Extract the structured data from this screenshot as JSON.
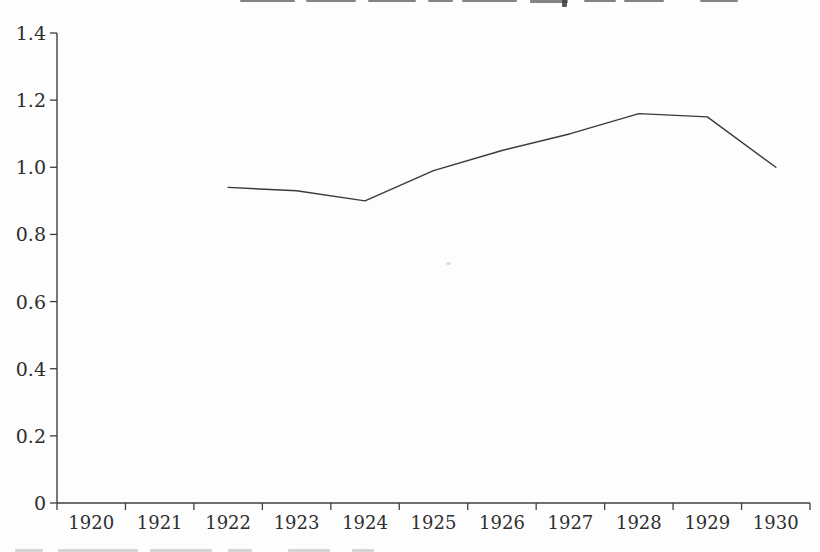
{
  "page": {
    "background": "#fdfdfd",
    "artifacts": {
      "top_edge": "bottom sliver of text line cut off at top of scan (illegible)",
      "bottom_edge": "top sliver of caption line cut off at bottom of scan (illegible)",
      "speck": "faint gray speck near plot center"
    }
  },
  "chart_data": {
    "type": "line",
    "title": "",
    "xlabel": "",
    "ylabel": "",
    "x": [
      1922,
      1923,
      1924,
      1925,
      1926,
      1927,
      1928,
      1929,
      1930
    ],
    "values": [
      0.94,
      0.93,
      0.9,
      0.99,
      1.05,
      1.1,
      1.16,
      1.15,
      1.0
    ],
    "x_axis_categories": [
      "1920",
      "1921",
      "1922",
      "1923",
      "1924",
      "1925",
      "1926",
      "1927",
      "1928",
      "1929",
      "1930"
    ],
    "x_axis_year_start": 1920,
    "x_axis_segments": 11,
    "yticks": [
      0,
      0.2,
      0.4,
      0.6,
      0.8,
      1.0,
      1.2,
      1.4
    ],
    "ytick_labels": [
      "0",
      "0.2",
      "0.4",
      "0.6",
      "0.8",
      "1.0",
      "1.2",
      "1.4"
    ],
    "ylim": [
      0,
      1.4
    ],
    "grid": false,
    "legend": "none",
    "axis_color": "#3f3f3f",
    "line_color": "#3a3a3a",
    "label_color": "#2e2e2e"
  }
}
